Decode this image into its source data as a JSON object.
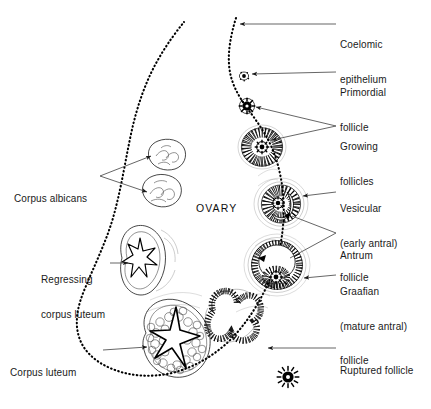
{
  "figure": {
    "center_label": "OVARY",
    "top_cut_text": "",
    "background_color": "#ffffff",
    "ink_color": "#000000"
  },
  "labels_right": [
    {
      "id": "coelomic-epithelium",
      "lines": [
        "Coelomic",
        "epithelium"
      ],
      "x": 340,
      "y": 20
    },
    {
      "id": "primordial-follicle",
      "lines": [
        "Primordial",
        "follicle"
      ],
      "x": 340,
      "y": 68
    },
    {
      "id": "growing-follicles",
      "lines": [
        "Growing",
        "follicles"
      ],
      "x": 340,
      "y": 121
    },
    {
      "id": "vesicular-follicle",
      "lines": [
        "Vesicular",
        "(early antral)",
        "follicle"
      ],
      "x": 340,
      "y": 185
    },
    {
      "id": "antrum",
      "lines": [
        "Antrum"
      ],
      "x": 340,
      "y": 229
    },
    {
      "id": "graafian-follicle",
      "lines": [
        "Graafian",
        "(mature antral)",
        "follicle"
      ],
      "x": 340,
      "y": 268
    },
    {
      "id": "ruptured-follicle",
      "lines": [
        "Ruptured follicle"
      ],
      "x": 340,
      "y": 343
    }
  ],
  "labels_left": [
    {
      "id": "corpus-albicans",
      "lines": [
        "Corpus albicans"
      ],
      "x": 14,
      "y": 171
    },
    {
      "id": "regressing-corpus-luteum",
      "lines": [
        "Regressing",
        "corpus luteum"
      ],
      "x": 41,
      "y": 253
    },
    {
      "id": "corpus-luteum",
      "lines": [
        "Corpus luteum"
      ],
      "x": 10,
      "y": 344
    }
  ],
  "structures": [
    {
      "id": "coelomic-epithelium-surface",
      "description": "dotted surface epithelium outlining the ovary"
    },
    {
      "id": "primordial-follicle-body",
      "description": "tiny follicle just under the surface"
    },
    {
      "id": "growing-follicle-small",
      "description": "small growing follicle with ring of granulosa cells"
    },
    {
      "id": "growing-follicle-large",
      "description": "larger growing follicle with stippled granulosa"
    },
    {
      "id": "vesicular-follicle-body",
      "description": "early antral follicle with crescent antrum"
    },
    {
      "id": "graafian-follicle-body",
      "description": "mature antral follicle with large antrum and cumulus oophorus"
    },
    {
      "id": "ruptured-follicle-body",
      "description": "collapsed folded follicle after ovulation"
    },
    {
      "id": "ovulated-oocyte",
      "description": "released oocyte with corona radiata"
    },
    {
      "id": "corpus-luteum-body",
      "description": "large folded corpus luteum with central clot"
    },
    {
      "id": "regressing-corpus-luteum-body",
      "description": "shrinking corpus luteum with stellate scar"
    },
    {
      "id": "corpus-albicans-upper",
      "description": "small scarred body, upper"
    },
    {
      "id": "corpus-albicans-lower",
      "description": "small scarred body, lower"
    }
  ]
}
